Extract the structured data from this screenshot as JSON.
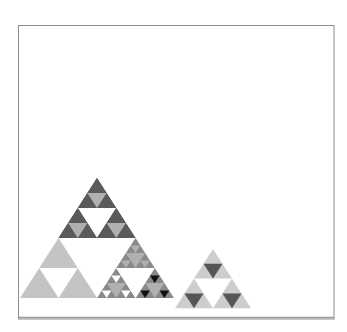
{
  "diagram": {
    "type": "sierpinski-triangles",
    "canvas": {
      "width": 347,
      "height": 332
    },
    "frame": {
      "x": 18.5,
      "y": 25.5,
      "width": 315.5,
      "height": 293.5,
      "stroke": "#8c8c8c"
    },
    "baseline_y": 317.5,
    "colors": {
      "white": "#ffffff",
      "light_gray": "#c4c4c4",
      "lighter_gray": "#cdcdcd",
      "mid_light": "#b0b0b0",
      "medium_gray": "#8a8a8a",
      "dark_gray": "#5a5a5a",
      "darker_gray": "#555555",
      "black": "#111111"
    },
    "triangles": [
      {
        "name": "large-sierpinski-triangle",
        "apex": [
          97,
          178
        ],
        "side": 154,
        "parts": {
          "top": {
            "name": "dark-top-section",
            "fill": "dark_gray",
            "hole": "white",
            "sub": {
              "fill": "dark_gray",
              "hole": "mid_light"
            }
          },
          "left": {
            "name": "light-bottom-left-section",
            "fill": "light_gray",
            "hole": "white"
          },
          "right": {
            "name": "detailed-bottom-right-section",
            "hole": "white",
            "top": {
              "fill": "medium_gray",
              "hole": "mid_light",
              "corner_hole": "mid_light"
            },
            "left": {
              "fill": "medium_gray",
              "hole": "mid_light",
              "corner_hole": "white"
            },
            "right": {
              "fill": "medium_gray",
              "hole": "mid_light",
              "corner_hole": "black"
            }
          }
        }
      },
      {
        "name": "small-sierpinski-triangle",
        "apex": [
          213,
          249
        ],
        "side": 76,
        "fill": "lighter_gray",
        "hole": "white",
        "sub_hole": "darker_gray"
      }
    ]
  }
}
